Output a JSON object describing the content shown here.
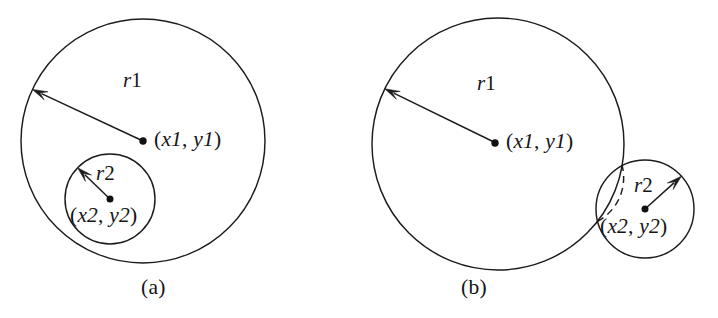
{
  "figure": {
    "background_color": "#ffffff",
    "stroke_color": "#1c1c1c",
    "panels": [
      {
        "id": "a",
        "caption": "(a)",
        "description": "Small circle entirely contained inside large circle",
        "large_circle": {
          "center_label_x": "x1",
          "center_label_y": "y1",
          "center_label": "(x1, y1)",
          "radius_label_var": "r",
          "radius_label_num": "1",
          "radius_label": "r1",
          "cx": 143,
          "cy": 141,
          "r": 122
        },
        "small_circle": {
          "center_label_x": "x2",
          "center_label_y": "y2",
          "center_label": "(x2, y2)",
          "radius_label_var": "r",
          "radius_label_num": "2",
          "radius_label": "r2",
          "cx": 110,
          "cy": 199,
          "r": 45
        }
      },
      {
        "id": "b",
        "caption": "(b)",
        "description": "Small circle overlapping the edge of the large circle, hidden arc dashed",
        "large_circle": {
          "center_label_x": "x1",
          "center_label_y": "y1",
          "center_label": "(x1, y1)",
          "radius_label_var": "r",
          "radius_label_num": "1",
          "radius_label": "r1",
          "cx": 498,
          "cy": 144,
          "r": 126
        },
        "small_circle": {
          "center_label_x": "x2",
          "center_label_y": "y2",
          "center_label": "(x2, y2)",
          "radius_label_var": "r",
          "radius_label_num": "2",
          "radius_label": "r2",
          "cx": 645,
          "cy": 209,
          "r": 49
        }
      }
    ]
  }
}
